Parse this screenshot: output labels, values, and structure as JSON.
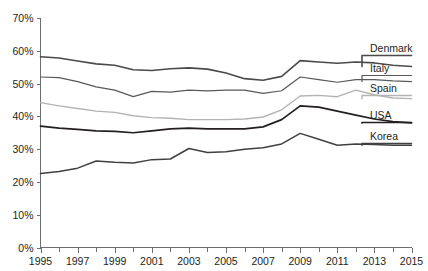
{
  "chart_data": {
    "type": "line",
    "title": "",
    "xlabel": "",
    "ylabel": "",
    "xlim": [
      1995,
      2015
    ],
    "ylim": [
      0,
      70
    ],
    "grid": false,
    "legend_position": "right-inline-labels",
    "y_tick_labels": [
      "0%",
      "10%",
      "20%",
      "30%",
      "40%",
      "50%",
      "60%",
      "70%"
    ],
    "y_tick_values": [
      0,
      10,
      20,
      30,
      40,
      50,
      60,
      70
    ],
    "x_tick_labels": [
      "1995",
      "1997",
      "1999",
      "2001",
      "2003",
      "2005",
      "2007",
      "2009",
      "2011",
      "2013",
      "2015"
    ],
    "x_tick_values": [
      1995,
      1997,
      1999,
      2001,
      2003,
      2005,
      2007,
      2009,
      2011,
      2013,
      2015
    ],
    "x_minor_ticks": [
      1996,
      1998,
      2000,
      2002,
      2004,
      2006,
      2008,
      2010,
      2012,
      2014
    ],
    "x": [
      1995,
      1996,
      1997,
      1998,
      1999,
      2000,
      2001,
      2002,
      2003,
      2004,
      2005,
      2006,
      2007,
      2008,
      2009,
      2010,
      2011,
      2012,
      2013,
      2014,
      2015
    ],
    "series": [
      {
        "name": "Denmark",
        "color": "#4a4a4a",
        "width": 1.6,
        "values": [
          58.2,
          57.8,
          56.9,
          56.0,
          55.6,
          54.2,
          54.0,
          54.5,
          54.8,
          54.4,
          53.2,
          51.5,
          51.0,
          52.2,
          57.0,
          56.6,
          56.2,
          56.6,
          56.3,
          55.6,
          55.2
        ]
      },
      {
        "name": "Italy",
        "color": "#58595b",
        "width": 1.2,
        "values": [
          52.0,
          51.8,
          50.6,
          49.0,
          48.0,
          46.0,
          47.6,
          47.4,
          48.0,
          47.8,
          48.0,
          48.0,
          47.0,
          47.8,
          52.0,
          51.2,
          50.4,
          51.2,
          51.2,
          50.8,
          50.6
        ]
      },
      {
        "name": "Spain",
        "color": "#b3b3b3",
        "width": 1.4,
        "values": [
          44.2,
          43.2,
          42.4,
          41.6,
          41.2,
          40.2,
          39.6,
          39.4,
          39.0,
          39.0,
          39.0,
          39.2,
          39.8,
          42.0,
          46.2,
          46.4,
          46.0,
          48.0,
          46.6,
          45.6,
          45.4
        ]
      },
      {
        "name": "USA",
        "color": "#231f20",
        "width": 1.7,
        "values": [
          37.0,
          36.4,
          36.0,
          35.6,
          35.4,
          35.0,
          35.6,
          36.2,
          36.4,
          36.2,
          36.2,
          36.2,
          36.8,
          39.0,
          43.2,
          42.8,
          41.6,
          40.4,
          39.2,
          38.4,
          38.0
        ]
      },
      {
        "name": "Korea",
        "color": "#404040",
        "width": 1.5,
        "values": [
          22.6,
          23.2,
          24.2,
          26.4,
          26.0,
          25.8,
          26.8,
          27.0,
          30.2,
          29.0,
          29.2,
          30.0,
          30.4,
          31.6,
          34.8,
          33.0,
          31.2,
          31.6,
          31.4,
          31.2,
          31.2
        ]
      }
    ]
  },
  "labels": {
    "denmark": "Denmark",
    "italy": "Italy",
    "spain": "Spain",
    "usa": "USA",
    "korea": "Korea"
  }
}
